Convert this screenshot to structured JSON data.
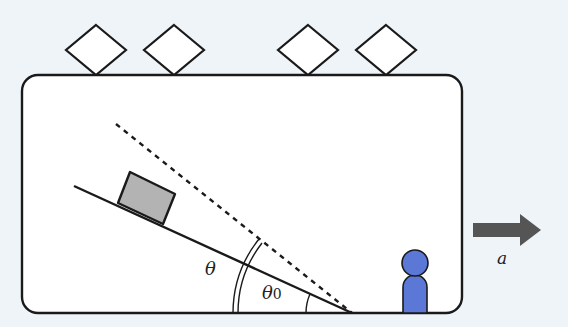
{
  "diagram": {
    "type": "physics-incline-in-accelerating-car",
    "labels": {
      "theta": "θ",
      "theta0": "θ",
      "theta0_sub": "0",
      "acceleration": "a"
    },
    "colors": {
      "background": "#eef4f8",
      "car_fill": "#ffffff",
      "stroke": "#1a1a1a",
      "block_fill": "#b3b3b3",
      "person_fill": "#5b78d6",
      "arrow_fill": "#555555"
    },
    "elements": [
      "car body (rounded rectangle)",
      "four diamond wheels on top",
      "inclined plane (solid line)",
      "dashed line at larger angle",
      "block on incline",
      "person standing",
      "acceleration arrow to the right"
    ]
  }
}
